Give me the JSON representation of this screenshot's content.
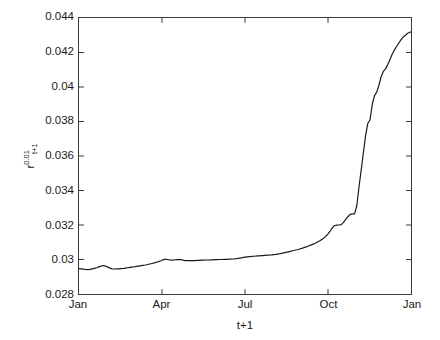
{
  "chart_data": {
    "type": "line",
    "title": "",
    "subtitle": "",
    "xlabel": "t+1",
    "ylabel": "r^{0.01}_{t+1}",
    "ylabel_base": "r",
    "ylabel_superscript": "0.01",
    "ylabel_subscript": "t+1",
    "grid": false,
    "legend": null,
    "legend_position": "none",
    "background_color": "#ffffff",
    "line_color": "#1a1a1a",
    "line_width": 1.2,
    "xlim": [
      0,
      12
    ],
    "ylim": [
      0.028,
      0.044
    ],
    "ytick_values": [
      0.028,
      0.03,
      0.032,
      0.034,
      0.036,
      0.038,
      0.04,
      0.042,
      0.044
    ],
    "ytick_labels": [
      "0.028",
      "0.03",
      "0.032",
      "0.034",
      "0.036",
      "0.038",
      "0.04",
      "0.042",
      "0.044"
    ],
    "xtick_values": [
      0,
      3,
      6,
      9,
      12
    ],
    "xtick_labels": [
      "Jan",
      "Apr",
      "Jul",
      "Oct",
      "Jan"
    ],
    "series": [
      {
        "name": "r_{t+1}^{0.01}",
        "x": [
          0.0,
          0.08,
          0.16,
          0.24,
          0.32,
          0.4,
          0.48,
          0.56,
          0.64,
          0.72,
          0.8,
          0.88,
          0.96,
          1.04,
          1.12,
          1.2,
          1.28,
          1.36,
          1.44,
          1.52,
          1.6,
          1.68,
          1.76,
          1.84,
          1.92,
          2.0,
          2.08,
          2.16,
          2.24,
          2.32,
          2.4,
          2.48,
          2.56,
          2.64,
          2.72,
          2.8,
          2.88,
          2.96,
          3.04,
          3.12,
          3.2,
          3.28,
          3.36,
          3.44,
          3.52,
          3.6,
          3.68,
          3.76,
          3.84,
          3.92,
          4.0,
          4.16,
          4.32,
          4.48,
          4.64,
          4.8,
          4.96,
          5.12,
          5.28,
          5.44,
          5.6,
          5.76,
          5.92,
          6.0,
          6.16,
          6.32,
          6.48,
          6.64,
          6.8,
          6.96,
          7.12,
          7.28,
          7.44,
          7.6,
          7.76,
          7.92,
          8.08,
          8.24,
          8.4,
          8.56,
          8.72,
          8.88,
          9.0,
          9.08,
          9.16,
          9.24,
          9.32,
          9.4,
          9.48,
          9.56,
          9.64,
          9.72,
          9.8,
          9.88,
          9.96,
          10.04,
          10.12,
          10.2,
          10.28,
          10.36,
          10.44,
          10.52,
          10.6,
          10.68,
          10.76,
          10.84,
          10.92,
          11.0,
          11.08,
          11.16,
          11.24,
          11.32,
          11.4,
          11.48,
          11.56,
          11.64,
          11.72,
          11.8,
          11.88,
          12.0
        ],
        "y": [
          0.02947,
          0.02946,
          0.02944,
          0.02942,
          0.02941,
          0.02943,
          0.02946,
          0.02949,
          0.02952,
          0.02957,
          0.02962,
          0.02965,
          0.02962,
          0.02956,
          0.0295,
          0.02946,
          0.02945,
          0.02946,
          0.02946,
          0.02947,
          0.02948,
          0.0295,
          0.02952,
          0.02954,
          0.02956,
          0.02958,
          0.0296,
          0.02962,
          0.02964,
          0.02966,
          0.02968,
          0.02971,
          0.02974,
          0.02977,
          0.0298,
          0.02984,
          0.02988,
          0.02993,
          0.02999,
          0.03001,
          0.03,
          0.02997,
          0.02996,
          0.02997,
          0.02999,
          0.03,
          0.02999,
          0.02996,
          0.02994,
          0.02993,
          0.02993,
          0.02994,
          0.02995,
          0.02996,
          0.02997,
          0.02998,
          0.02999,
          0.03,
          0.03001,
          0.03002,
          0.03003,
          0.03007,
          0.03011,
          0.03014,
          0.03017,
          0.03019,
          0.03021,
          0.03023,
          0.03025,
          0.03027,
          0.0303,
          0.03034,
          0.0304,
          0.03046,
          0.03052,
          0.03058,
          0.03066,
          0.03075,
          0.03085,
          0.03096,
          0.0311,
          0.03128,
          0.03148,
          0.03165,
          0.03185,
          0.03197,
          0.03199,
          0.032,
          0.03202,
          0.03215,
          0.03232,
          0.03248,
          0.03262,
          0.03264,
          0.03265,
          0.0331,
          0.0342,
          0.0352,
          0.0362,
          0.0372,
          0.0379,
          0.0381,
          0.039,
          0.0395,
          0.0397,
          0.0401,
          0.0406,
          0.0409,
          0.04105,
          0.0413,
          0.0416,
          0.0419,
          0.04215,
          0.04235,
          0.04255,
          0.04275,
          0.0429,
          0.043,
          0.04312,
          0.0432
        ]
      }
    ]
  }
}
